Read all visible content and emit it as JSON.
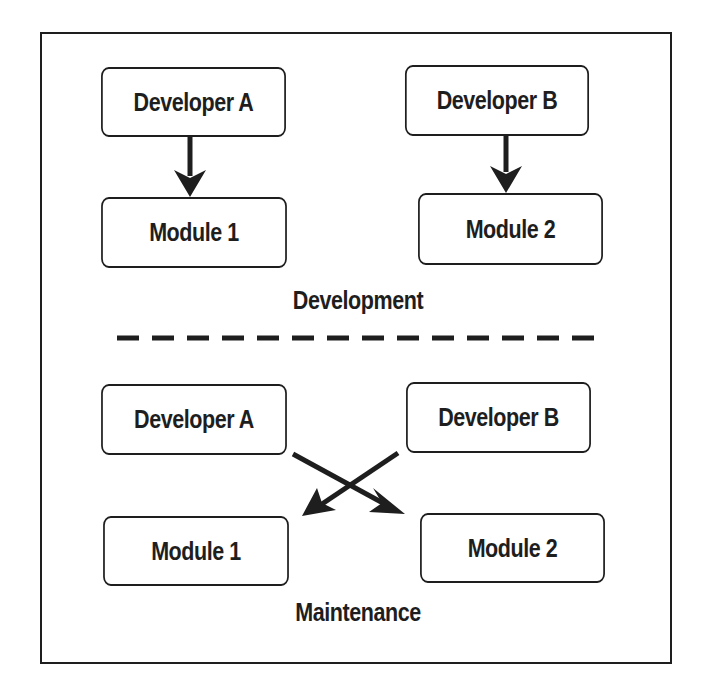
{
  "diagram": {
    "type": "flow",
    "colors": {
      "stroke": "#1e1e1e",
      "background": "#ffffff",
      "text": "#1e1e1e"
    },
    "development": {
      "label": "Development",
      "nodes": [
        {
          "id": "dev-a",
          "label": "Developer A"
        },
        {
          "id": "dev-b",
          "label": "Developer B"
        },
        {
          "id": "mod-1",
          "label": "Module 1"
        },
        {
          "id": "mod-2",
          "label": "Module 2"
        }
      ],
      "edges": [
        {
          "from": "Developer A",
          "to": "Module 1"
        },
        {
          "from": "Developer B",
          "to": "Module 2"
        }
      ]
    },
    "separator": "dashed-line",
    "maintenance": {
      "label": "Maintenance",
      "nodes": [
        {
          "id": "dev-a",
          "label": "Developer A"
        },
        {
          "id": "dev-b",
          "label": "Developer B"
        },
        {
          "id": "mod-1",
          "label": "Module 1"
        },
        {
          "id": "mod-2",
          "label": "Module 2"
        }
      ],
      "edges": [
        {
          "from": "Developer A",
          "to": "Module 2"
        },
        {
          "from": "Developer B",
          "to": "Module 1"
        }
      ]
    }
  }
}
